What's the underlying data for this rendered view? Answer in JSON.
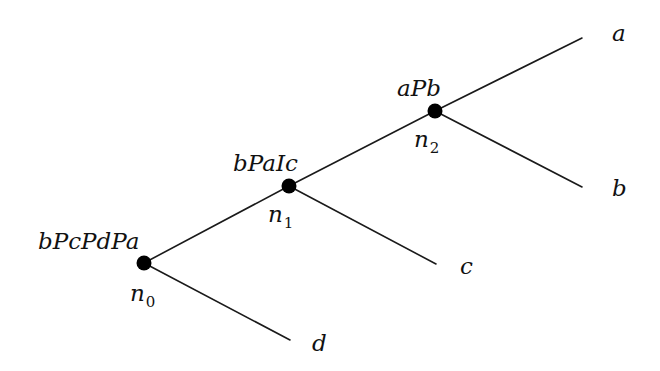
{
  "diagram": {
    "type": "game-tree",
    "line_color": "#1a1a1a",
    "node_color": "#000000",
    "nodes": [
      {
        "id": "n0",
        "name": "n",
        "sub": "0",
        "preference": "bPcPdPa",
        "x": 144,
        "y": 263
      },
      {
        "id": "n1",
        "name": "n",
        "sub": "1",
        "preference": "bPaIc",
        "x": 289,
        "y": 186
      },
      {
        "id": "n2",
        "name": "n",
        "sub": "2",
        "preference": "aPb",
        "x": 435,
        "y": 111
      }
    ],
    "leaves": [
      {
        "label": "a",
        "x": 582,
        "y": 38
      },
      {
        "label": "b",
        "x": 582,
        "y": 187
      },
      {
        "label": "c",
        "x": 436,
        "y": 264
      },
      {
        "label": "d",
        "x": 290,
        "y": 340
      }
    ],
    "edges": [
      {
        "from": "n0",
        "to": "n1"
      },
      {
        "from": "n0",
        "to": "d"
      },
      {
        "from": "n1",
        "to": "n2"
      },
      {
        "from": "n1",
        "to": "c"
      },
      {
        "from": "n2",
        "to": "a"
      },
      {
        "from": "n2",
        "to": "b"
      }
    ]
  }
}
